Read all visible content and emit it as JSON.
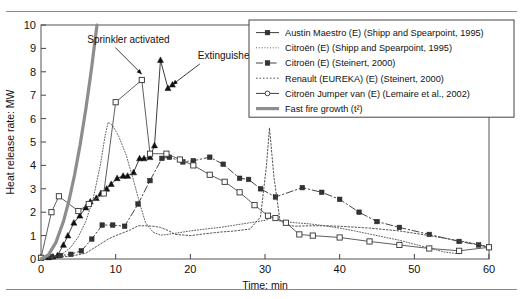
{
  "figure": {
    "clipped_caption_fragment": "",
    "background": "#ffffff",
    "frame_color": "#555555",
    "rule_color": "#8a8a8a"
  },
  "chart_data": {
    "type": "line",
    "title": "",
    "xlabel": "Time: min",
    "ylabel": "Heat release rate: MW",
    "xlim": [
      0,
      60
    ],
    "ylim": [
      0,
      10
    ],
    "xticks": [
      0,
      10,
      20,
      30,
      40,
      50,
      60
    ],
    "yticks": [
      0,
      1,
      2,
      3,
      4,
      5,
      6,
      7,
      8,
      9,
      10
    ],
    "xtick_labels": [
      "0",
      "10",
      "20",
      "30",
      "40",
      "50",
      "60"
    ],
    "ytick_labels": [
      "0",
      "1",
      "2",
      "3",
      "4",
      "5",
      "6",
      "7",
      "8",
      "9",
      "10"
    ],
    "grid": false,
    "legend_position": "top-right",
    "series": [
      {
        "name": "Austin Maestro (E) (Shipp and Spearpoint, 1995)",
        "style": "solid",
        "marker": "filled-triangle",
        "color": "#333333",
        "x": [
          0,
          1,
          1.6,
          2.2,
          3,
          3.6,
          4.4,
          5.2,
          6,
          6.6,
          7.4,
          8,
          8.8,
          9.4,
          10.2,
          11,
          11.6,
          12.4,
          13.2,
          13.8,
          14.6,
          15.2,
          16,
          17,
          17.6
        ],
        "y": [
          0.05,
          0.07,
          0.1,
          0.15,
          0.6,
          1.0,
          1.55,
          1.85,
          2.2,
          2.45,
          2.6,
          2.8,
          3.0,
          3.2,
          3.45,
          3.55,
          3.55,
          3.7,
          4.3,
          4.3,
          4.35,
          4.85,
          8.5,
          7.3,
          7.45
        ]
      },
      {
        "name": "Citroën (E) (Shipp and Spearpoint, 1995)",
        "style": "fine-dotted",
        "marker": "none",
        "color": "#555555",
        "x": [
          0,
          1,
          2,
          3,
          4,
          5,
          6,
          7,
          8,
          8.6,
          9,
          9.6,
          10.4,
          11.4,
          12.4,
          13.2,
          14,
          15,
          16,
          17,
          18,
          20,
          22,
          24,
          26,
          28,
          30,
          31,
          32,
          34,
          36,
          38,
          40,
          42,
          45,
          48,
          51,
          54,
          56
        ],
        "y": [
          0.05,
          0.07,
          0.12,
          0.25,
          0.5,
          0.95,
          1.6,
          2.6,
          4.1,
          5.3,
          5.85,
          5.7,
          5.25,
          4.45,
          3.35,
          2.4,
          1.55,
          1.15,
          1.02,
          1.05,
          1.1,
          1.2,
          1.28,
          1.35,
          1.45,
          1.55,
          1.65,
          1.78,
          1.62,
          1.55,
          1.5,
          1.42,
          1.32,
          1.2,
          1.0,
          0.8,
          0.55,
          0.3,
          0.22
        ]
      },
      {
        "name": "Citroën (E) (Steinert, 2000)",
        "style": "dash-dot",
        "marker": "filled-square",
        "color": "#3a3a3a",
        "x": [
          0,
          1.4,
          2.6,
          4,
          5.4,
          6.8,
          8.2,
          9.6,
          11.2,
          13,
          14.6,
          16.2,
          17.2,
          19,
          20.4,
          22.6,
          24.4,
          26.6,
          27.8,
          29.4,
          31.4,
          35,
          37.6,
          40,
          42.6,
          45,
          48,
          52,
          56,
          58.6,
          60
        ],
        "y": [
          0.05,
          0.1,
          0.15,
          0.2,
          0.35,
          0.85,
          1.45,
          1.45,
          1.4,
          2.35,
          3.35,
          4.3,
          4.35,
          4.15,
          4.2,
          4.35,
          4.05,
          3.45,
          3.4,
          3.0,
          2.65,
          3.05,
          2.85,
          2.55,
          2.0,
          1.6,
          1.35,
          1.05,
          0.75,
          0.6,
          0.5
        ]
      },
      {
        "name": "Renault (EUREKA) (E) (Steinert, 2000)",
        "style": "dotted",
        "marker": "none",
        "color": "#4a4a4a",
        "x": [
          0,
          2,
          4,
          6,
          7.5,
          9,
          10,
          11,
          12,
          13,
          14,
          15,
          16,
          17,
          18,
          20,
          22,
          24,
          26,
          28,
          29.4,
          30.2,
          30.6,
          31.2,
          32,
          33,
          34,
          36,
          38,
          40,
          44,
          48,
          52,
          56,
          59,
          60
        ],
        "y": [
          0.05,
          0.08,
          0.12,
          0.25,
          0.55,
          0.85,
          1.0,
          1.12,
          1.25,
          1.42,
          1.42,
          1.4,
          1.35,
          1.22,
          1.05,
          1.0,
          1.08,
          1.15,
          1.2,
          1.28,
          1.8,
          4.0,
          5.6,
          3.5,
          1.65,
          1.45,
          1.4,
          1.42,
          1.42,
          1.4,
          1.32,
          1.2,
          1.0,
          0.78,
          0.6,
          0.5
        ]
      },
      {
        "name": "Citroën Jumper van (E) (Lemaire et al., 2002)",
        "style": "solid",
        "marker": "open-square",
        "color": "#555555",
        "x": [
          0,
          1.4,
          2.4,
          5,
          6.4,
          8.4,
          10,
          13.5,
          14.6,
          16.8,
          18.6,
          20.4,
          22.6,
          24.6,
          26.6,
          28.6,
          30.4,
          31.4,
          32.8,
          34.6,
          36.4,
          40,
          44,
          48,
          52,
          56,
          60
        ],
        "y": [
          0.05,
          2.0,
          2.68,
          2.05,
          2.35,
          2.8,
          6.7,
          7.65,
          4.5,
          4.5,
          4.25,
          4.0,
          3.6,
          3.3,
          2.85,
          2.3,
          1.85,
          1.75,
          1.55,
          1.05,
          1.0,
          0.92,
          0.75,
          0.6,
          0.45,
          0.35,
          0.5
        ]
      },
      {
        "name": "Fast fire growth (t²)",
        "style": "thick-solid",
        "marker": "none",
        "color": "#8d8d8d",
        "x": [
          0,
          1,
          2,
          3,
          3.75,
          4.5,
          5.25,
          6,
          6.75,
          7.5
        ],
        "y": [
          0,
          0.178,
          0.711,
          1.6,
          2.5,
          3.6,
          4.9,
          6.4,
          8.1,
          10.0
        ]
      }
    ],
    "annotations": [
      {
        "id": "sprinkler-activated",
        "text": "Sprinkler activated",
        "label_x": 6.2,
        "label_y": 9.25,
        "point_x": 13.5,
        "point_y": 7.9
      },
      {
        "id": "extinguished",
        "text": "Extinguished",
        "label_x": 21.0,
        "label_y": 8.55,
        "point_x": 17.6,
        "point_y": 7.45
      }
    ]
  },
  "legend": {
    "items": [
      {
        "label": "Austin Maestro (E) (Shipp and Spearpoint, 1995)",
        "swatch": "solid-filled-triangle"
      },
      {
        "label": "Citroën (E) (Shipp and Spearpoint, 1995)",
        "swatch": "fine-dotted"
      },
      {
        "label": "Citroën (E) (Steinert, 2000)",
        "swatch": "dash-dot-square"
      },
      {
        "label": "Renault (EUREKA) (E) (Steinert, 2000)",
        "swatch": "dotted"
      },
      {
        "label": "Citroën Jumper van (E) (Lemaire et al., 2002)",
        "swatch": "solid-open-square"
      },
      {
        "label": "Fast fire growth (t²)",
        "swatch": "thick-gray-solid"
      }
    ]
  }
}
